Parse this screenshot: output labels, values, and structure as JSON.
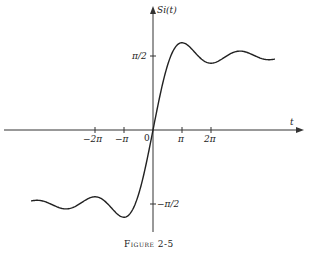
{
  "chart_data": {
    "type": "line",
    "title": "",
    "caption": "Figure 2-5",
    "xlabel": "t",
    "ylabel": "Si(t)",
    "function": "Si(t) = integral from 0 to t of sin(x)/x dx",
    "x_ticks": [
      {
        "label": "-2π",
        "value": -6.2832
      },
      {
        "label": "-π",
        "value": -3.1416
      },
      {
        "label": "0",
        "value": 0
      },
      {
        "label": "π",
        "value": 3.1416
      },
      {
        "label": "2π",
        "value": 6.2832
      }
    ],
    "y_ticks": [
      {
        "label": "π/2",
        "value": 1.5708
      },
      {
        "label": "-π/2",
        "value": -1.5708
      }
    ],
    "xlim": [
      -4.2,
      4.2
    ],
    "xlim_units": "multiples of π",
    "grid": false,
    "legend": "none",
    "series": [
      {
        "name": "Si(t)",
        "x_over_pi": [
          -4,
          -3.5,
          -3,
          -2.5,
          -2,
          -1.5,
          -1,
          -0.5,
          0,
          0.5,
          1,
          1.5,
          2,
          2.5,
          3,
          3.5,
          4
        ],
        "y": [
          -1.492,
          -1.633,
          -1.675,
          -1.534,
          -1.418,
          -1.602,
          -1.852,
          -1.371,
          0,
          1.371,
          1.852,
          1.602,
          1.418,
          1.534,
          1.675,
          1.633,
          1.492
        ]
      }
    ]
  },
  "labels": {
    "y_axis": "Si(t)",
    "x_axis": "t",
    "origin": "0",
    "pi": "π",
    "two_pi": "2π",
    "neg_pi": "−π",
    "neg_two_pi": "−2π",
    "half_pi": "π/2",
    "neg_half_pi": "−π/2",
    "caption": "Figure 2-5"
  }
}
